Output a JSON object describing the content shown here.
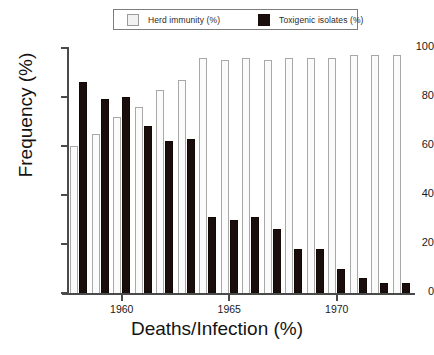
{
  "chart_data": {
    "type": "bar",
    "title": "",
    "xlabel": "Deaths/Infection (%)",
    "ylabel": "Frequency (%)",
    "categories": [
      1958,
      1959,
      1960,
      1961,
      1962,
      1963,
      1964,
      1965,
      1966,
      1967,
      1968,
      1969,
      1970,
      1971,
      1972,
      1973
    ],
    "series": [
      {
        "name": "Herd immunity (%)",
        "color": "#fbfbfb",
        "values": [
          60,
          65,
          72,
          76,
          83,
          87,
          96,
          95,
          96,
          95,
          96,
          96,
          96,
          97,
          97,
          97
        ]
      },
      {
        "name": "Toxigenic isolates (%)",
        "color": "#190e0c",
        "values": [
          86,
          79,
          80,
          68,
          62,
          63,
          31,
          30,
          31,
          26,
          18,
          18,
          10,
          6,
          4,
          4
        ]
      }
    ],
    "ylim": [
      0,
      100
    ],
    "yticks": [
      0,
      20,
      40,
      60,
      80,
      100
    ],
    "xticks": [
      1960,
      1965,
      1970
    ],
    "xtick_labels": [
      "1960",
      "1965",
      "1970"
    ],
    "grid": false,
    "legend_position": "top-center"
  },
  "legend": {
    "entries": [
      {
        "label": "Herd immunity (%)",
        "swatch": "herd"
      },
      {
        "label": "Toxigenic isolates (%)",
        "swatch": "tox"
      }
    ]
  },
  "axes": {
    "y_title": "Frequency (%)",
    "x_title": "Deaths/Infection (%)",
    "y_tick_labels": [
      "100",
      "80",
      "60",
      "40",
      "20",
      "0"
    ],
    "x_tick_labels": [
      "1960",
      "1965",
      "1970"
    ]
  }
}
